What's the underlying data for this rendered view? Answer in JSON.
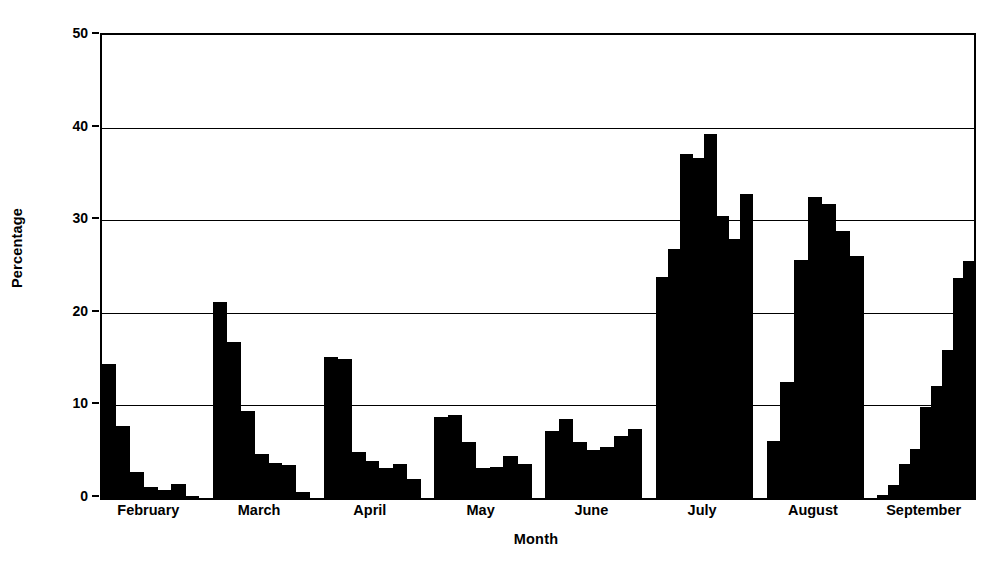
{
  "chart_data": {
    "type": "bar",
    "title": "",
    "xlabel": "Month",
    "ylabel": "Percentage",
    "ylim": [
      0,
      50
    ],
    "yticks": [
      0,
      10,
      20,
      30,
      40,
      50
    ],
    "ytick_labels": [
      "0",
      "10",
      "20",
      "30",
      "40",
      "50"
    ],
    "grid": true,
    "legend": false,
    "bar_color": "#000000",
    "background_color": "#ffffff",
    "axis_color": "#000000",
    "categories": [
      "February",
      "March",
      "April",
      "May",
      "June",
      "July",
      "August",
      "September"
    ],
    "groups": [
      {
        "name": "February",
        "values": [
          14.5,
          7.8,
          2.8,
          1.2,
          0.9,
          1.5,
          0.2
        ]
      },
      {
        "name": "March",
        "values": [
          21.2,
          16.8,
          9.4,
          4.7,
          3.8,
          3.6,
          0.7
        ]
      },
      {
        "name": "April",
        "values": [
          15.2,
          15.0,
          5.0,
          4.0,
          3.2,
          3.7,
          2.0
        ]
      },
      {
        "name": "May",
        "values": [
          8.8,
          9.0,
          6.0,
          3.2,
          3.3,
          4.5,
          3.7
        ]
      },
      {
        "name": "June",
        "values": [
          7.2,
          8.5,
          6.0,
          5.2,
          5.5,
          6.7,
          7.5
        ]
      },
      {
        "name": "July",
        "values": [
          23.9,
          26.9,
          37.1,
          36.7,
          39.3,
          30.5,
          28.0,
          32.8
        ]
      },
      {
        "name": "August",
        "values": [
          6.2,
          12.5,
          25.7,
          32.5,
          31.7,
          28.8,
          26.1
        ]
      },
      {
        "name": "September",
        "values": [
          0.3,
          1.4,
          3.7,
          5.3,
          9.8,
          12.1,
          16.0,
          23.8,
          25.6
        ]
      }
    ]
  }
}
